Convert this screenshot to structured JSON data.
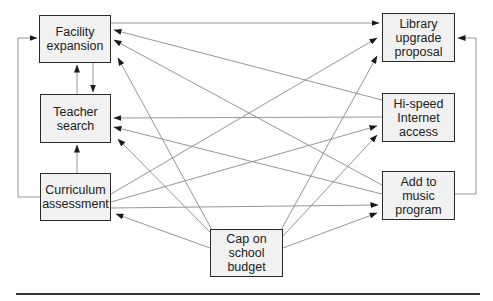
{
  "diagram": {
    "type": "influence-diagram",
    "nodes": [
      {
        "id": "facility",
        "label": "Facility\nexpansion",
        "x": 39,
        "y": 15,
        "w": 72,
        "h": 48
      },
      {
        "id": "teacher",
        "label": "Teacher\nsearch",
        "x": 40,
        "y": 94,
        "w": 71,
        "h": 49
      },
      {
        "id": "curriculum",
        "label": "Curriculum\nassessment",
        "x": 40,
        "y": 173,
        "w": 71,
        "h": 48
      },
      {
        "id": "library",
        "label": "Library\nupgrade\nproposal",
        "x": 382,
        "y": 13,
        "w": 73,
        "h": 49
      },
      {
        "id": "internet",
        "label": "Hi-speed\nInternet\naccess",
        "x": 382,
        "y": 93,
        "w": 73,
        "h": 49
      },
      {
        "id": "music",
        "label": "Add to\nmusic\nprogram",
        "x": 382,
        "y": 171,
        "w": 73,
        "h": 49
      },
      {
        "id": "cap",
        "label": "Cap on\nschool\nbudget",
        "x": 210,
        "y": 229,
        "w": 73,
        "h": 48
      }
    ],
    "edges": [
      {
        "from": "facility",
        "to": "library"
      },
      {
        "from": "facility",
        "to": "teacher"
      },
      {
        "from": "teacher",
        "to": "facility"
      },
      {
        "from": "curriculum",
        "to": "teacher"
      },
      {
        "from": "curriculum",
        "to": "facility"
      },
      {
        "from": "internet",
        "to": "facility"
      },
      {
        "from": "music",
        "to": "facility"
      },
      {
        "from": "cap",
        "to": "facility"
      },
      {
        "from": "internet",
        "to": "teacher"
      },
      {
        "from": "music",
        "to": "teacher"
      },
      {
        "from": "cap",
        "to": "teacher"
      },
      {
        "from": "curriculum",
        "to": "library"
      },
      {
        "from": "curriculum",
        "to": "internet"
      },
      {
        "from": "curriculum",
        "to": "music"
      },
      {
        "from": "cap",
        "to": "curriculum"
      },
      {
        "from": "cap",
        "to": "library"
      },
      {
        "from": "cap",
        "to": "internet"
      },
      {
        "from": "cap",
        "to": "music"
      },
      {
        "from": "music",
        "to": "library"
      }
    ]
  },
  "labels": {
    "facility": "Facility\nexpansion",
    "teacher": "Teacher\nsearch",
    "curriculum": "Curriculum\nassessment",
    "library": "Library\nupgrade\nproposal",
    "internet": "Hi-speed\nInternet\naccess",
    "music": "Add to\nmusic\nprogram",
    "cap": "Cap on\nschool\nbudget"
  },
  "colors": {
    "line": "#8a8a8a",
    "arrowhead": "#1a1a1a",
    "box_border": "#2a2a2a",
    "box_fill": "#f1f1f1"
  }
}
